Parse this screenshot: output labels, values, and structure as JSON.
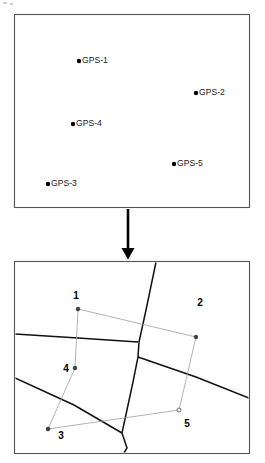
{
  "figure": {
    "background_color": "#ffffff",
    "width": 265,
    "height": 463
  },
  "top_panel": {
    "name": "GPS control point map",
    "frame": {
      "x": 14.5,
      "y": 14.5,
      "width": 235,
      "height": 193,
      "stroke": "#555555"
    },
    "points": [
      {
        "id": "gps-1",
        "label": "GPS-1",
        "dot_x": 79,
        "dot_y": 61,
        "label_x": 82,
        "label_y": 61
      },
      {
        "id": "gps-2",
        "label": "GPS-2",
        "dot_x": 196,
        "dot_y": 93,
        "label_x": 199,
        "label_y": 93
      },
      {
        "id": "gps-4",
        "label": "GPS-4",
        "dot_x": 73,
        "dot_y": 124,
        "label_x": 76,
        "label_y": 124
      },
      {
        "id": "gps-5",
        "label": "GPS-5",
        "dot_x": 174,
        "dot_y": 164,
        "label_x": 177,
        "label_y": 164
      },
      {
        "id": "gps-3",
        "label": "GPS-3",
        "dot_x": 48,
        "dot_y": 184,
        "label_x": 51,
        "label_y": 184
      }
    ]
  },
  "flow_arrow": {
    "name": "downward flow arrow",
    "x": 128,
    "y_start": 209,
    "y_end": 249,
    "head_points": "121,248 135,248 128,259",
    "color": "#000000"
  },
  "bottom_panel": {
    "name": "cadastral parcel map",
    "frame": {
      "x": 14.5,
      "y": 261.5,
      "width": 235,
      "height": 192,
      "stroke": "#555555"
    },
    "parcel_boundaries": [
      {
        "id": "boundary-upper-horizontal",
        "points": "14,335 78,338 137,342"
      },
      {
        "id": "boundary-main-vertical",
        "points": "156,261 139,342 137,357 122,433"
      },
      {
        "id": "boundary-mid-diagonal",
        "points": "137,357 196,376 249,398"
      },
      {
        "id": "boundary-lower-diagonal",
        "points": "14,378 74,405 122,433"
      },
      {
        "id": "boundary-bottom-stub",
        "points": "122,433 127,449 124,463"
      }
    ],
    "survey_links": [
      {
        "id": "link-1-2",
        "points": "78,309 196,337"
      },
      {
        "id": "link-1-4",
        "points": "78,309 75,368"
      },
      {
        "id": "link-4-3",
        "points": "75,368 48,429"
      },
      {
        "id": "link-3-5",
        "points": "48,429 179,410"
      },
      {
        "id": "link-2-5",
        "points": "196,337 179,410"
      }
    ],
    "survey_nodes": [
      {
        "id": "node-1",
        "x": 78,
        "y": 309,
        "style": "filled"
      },
      {
        "id": "node-2",
        "x": 196,
        "y": 337,
        "style": "filled"
      },
      {
        "id": "node-4",
        "x": 75,
        "y": 368,
        "style": "filled"
      },
      {
        "id": "node-5",
        "x": 179,
        "y": 410,
        "style": "open"
      },
      {
        "id": "node-3",
        "x": 48,
        "y": 429,
        "style": "filled"
      }
    ],
    "parcel_numbers": [
      {
        "id": "parcel-1",
        "label": "1",
        "x": 76,
        "y": 296
      },
      {
        "id": "parcel-2",
        "label": "2",
        "x": 200,
        "y": 303
      },
      {
        "id": "parcel-4",
        "label": "4",
        "x": 66,
        "y": 369
      },
      {
        "id": "parcel-5",
        "label": "5",
        "x": 187,
        "y": 424
      },
      {
        "id": "parcel-3",
        "label": "3",
        "x": 61,
        "y": 436
      }
    ]
  },
  "colors": {
    "frame": "#555555",
    "boundary": "#111111",
    "link": "#9a9a9a",
    "text": "#000000",
    "arrow": "#000000"
  }
}
